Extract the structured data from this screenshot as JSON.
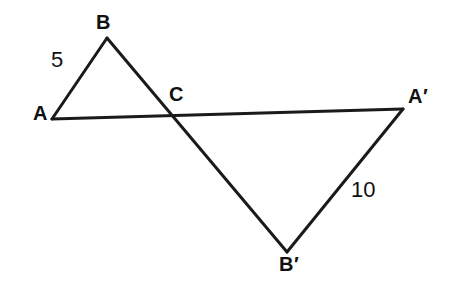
{
  "figure": {
    "background_color": "#ffffff",
    "stroke_color": "#1a1a1a",
    "stroke_width": 3,
    "canvas": {
      "width": 461,
      "height": 296
    },
    "vertices": [
      {
        "id": "A",
        "label": "A",
        "x": 52,
        "y": 119
      },
      {
        "id": "B",
        "label": "B",
        "x": 107,
        "y": 38
      },
      {
        "id": "C",
        "label": "C",
        "x": 172,
        "y": 112
      },
      {
        "id": "Ap",
        "label": "A′",
        "x": 403,
        "y": 109
      },
      {
        "id": "Bp",
        "label": "B′",
        "x": 287,
        "y": 252
      }
    ],
    "segments": [
      {
        "id": "AB",
        "from": "A",
        "to": "B",
        "label": "5"
      },
      {
        "id": "BBp",
        "from": "B",
        "to": "Bp",
        "label": ""
      },
      {
        "id": "AAp",
        "from": "A",
        "to": "Ap",
        "label": ""
      },
      {
        "id": "BpAp",
        "from": "Bp",
        "to": "Ap",
        "label": "10"
      }
    ],
    "measures": [
      {
        "id": "len-AB",
        "segment": "AB",
        "value": "5",
        "x": 51,
        "y": 49
      },
      {
        "id": "len-BpAp",
        "segment": "BpAp",
        "value": "10",
        "x": 351,
        "y": 179
      }
    ],
    "labels": {
      "A": "A",
      "B": "B",
      "C": "C",
      "A_prime": "A′",
      "B_prime": "B′",
      "length_AB": "5",
      "length_BpAp": "10"
    }
  },
  "chart_data": {
    "type": "diagram",
    "subtype": "geometry-line-figure",
    "points": {
      "A": [
        52,
        119
      ],
      "B": [
        107,
        38
      ],
      "C": [
        172,
        112
      ],
      "A'": [
        403,
        109
      ],
      "B'": [
        287,
        252
      ]
    },
    "polylines": [
      [
        "A",
        "B",
        "C",
        "B'"
      ],
      [
        "A",
        "C",
        "A'",
        "B'"
      ]
    ],
    "edge_labels": {
      "AB": "5",
      "A'B'": "10"
    },
    "xlim": [
      0,
      461
    ],
    "ylim": [
      0,
      296
    ],
    "grid": false,
    "legend": null
  }
}
